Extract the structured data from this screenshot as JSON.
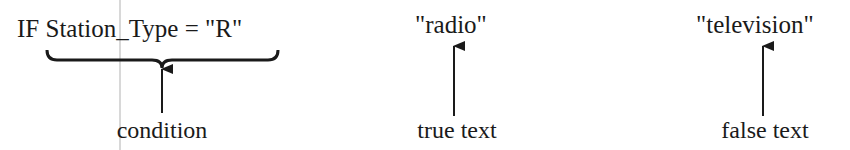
{
  "diagram": {
    "expression": {
      "condition_code": "IF Station_Type = \"R\"",
      "true_value": "\"radio\"",
      "false_value": "\"television\""
    },
    "labels": {
      "condition": "condition",
      "true_text": "true text",
      "false_text": "false text"
    },
    "colors": {
      "ink": "#1a1a1a",
      "seam": "#d8d8d8"
    }
  }
}
